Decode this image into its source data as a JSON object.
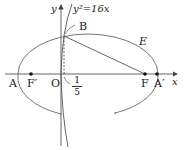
{
  "diagram": {
    "axes": {
      "x_label": "x",
      "y_label": "y",
      "origin_label": "O"
    },
    "curves": {
      "parabola_label": "y²=16x",
      "ellipse_label": "E"
    },
    "points": {
      "A": "A",
      "F_prime": "F′",
      "F": "F",
      "A_prime": "A′",
      "B": "B"
    },
    "tick": {
      "numerator": "1",
      "denominator": "5"
    },
    "colors": {
      "stroke": "#555555",
      "point": "#111111"
    }
  }
}
